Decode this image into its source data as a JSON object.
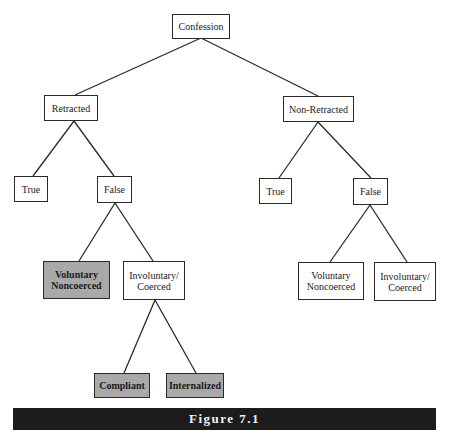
{
  "diagram": {
    "nodes": {
      "confession": "Confession",
      "retracted": "Retracted",
      "non_retracted": "Non-Retracted",
      "retracted_true": "True",
      "retracted_false": "False",
      "nonretracted_true": "True",
      "nonretracted_false": "False",
      "retracted_voluntary": "Voluntary\nNoncoerced",
      "retracted_involuntary": "Involuntary/\nCoerced",
      "nonretracted_voluntary": "Voluntary\nNoncoerced",
      "nonretracted_involuntary": "Involuntary/\nCoerced",
      "compliant": "Compliant",
      "internalized": "Internalized"
    },
    "edges": [
      [
        "confession",
        "retracted"
      ],
      [
        "confession",
        "non_retracted"
      ],
      [
        "retracted",
        "retracted_true"
      ],
      [
        "retracted",
        "retracted_false"
      ],
      [
        "non_retracted",
        "nonretracted_true"
      ],
      [
        "non_retracted",
        "nonretracted_false"
      ],
      [
        "retracted_false",
        "retracted_voluntary"
      ],
      [
        "retracted_false",
        "retracted_involuntary"
      ],
      [
        "nonretracted_false",
        "nonretracted_voluntary"
      ],
      [
        "nonretracted_false",
        "nonretracted_involuntary"
      ],
      [
        "retracted_involuntary",
        "compliant"
      ],
      [
        "retracted_involuntary",
        "internalized"
      ]
    ],
    "shaded_nodes": [
      "retracted_voluntary",
      "compliant",
      "internalized"
    ],
    "colors": {
      "shaded_fill": "#a9a9a9",
      "caption_bg": "#1c1c1c",
      "caption_text": "#f2f2f2"
    }
  },
  "caption": "Figure 7.1"
}
